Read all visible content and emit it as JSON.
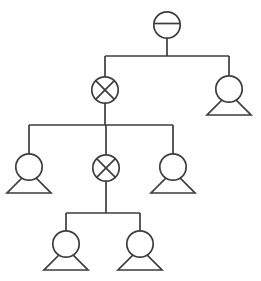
{
  "diagram": {
    "type": "tree",
    "canvas": {
      "width": 261,
      "height": 281
    },
    "style": {
      "background_color": "#ffffff",
      "stroke_color": "#3d3d3d",
      "node_fill_color": "#ffffff",
      "stroke_width": 1.7,
      "node_radius": 13.2,
      "figure_base_half_width": 22,
      "figure_base_offset_y": 26,
      "figure_apex_offset_y": 4,
      "hbar_offset_y": -1.5
    },
    "nodes": [
      {
        "id": "root",
        "type": "circle-with-bar",
        "x": 167,
        "y": 25
      },
      {
        "id": "gen2-left",
        "type": "circle-with-x",
        "x": 105,
        "y": 90
      },
      {
        "id": "gen2-right",
        "type": "person-figure",
        "x": 229,
        "y": 89
      },
      {
        "id": "gen3-left",
        "type": "person-figure",
        "x": 29,
        "y": 167
      },
      {
        "id": "gen3-middle",
        "type": "circle-with-x",
        "x": 106,
        "y": 168
      },
      {
        "id": "gen3-right",
        "type": "person-figure",
        "x": 173,
        "y": 167
      },
      {
        "id": "gen4-left",
        "type": "person-figure",
        "x": 66,
        "y": 244
      },
      {
        "id": "gen4-right",
        "type": "person-figure",
        "x": 140,
        "y": 244
      }
    ],
    "edges": [
      {
        "from": "root",
        "to": [
          "gen2-left",
          "gen2-right"
        ],
        "bus_y": 56
      },
      {
        "from": "gen2-left",
        "to": [
          "gen3-left",
          "gen3-middle",
          "gen3-right"
        ],
        "bus_y": 125
      },
      {
        "from": "gen3-middle",
        "to": [
          "gen4-left",
          "gen4-right"
        ],
        "bus_y": 213
      }
    ]
  }
}
